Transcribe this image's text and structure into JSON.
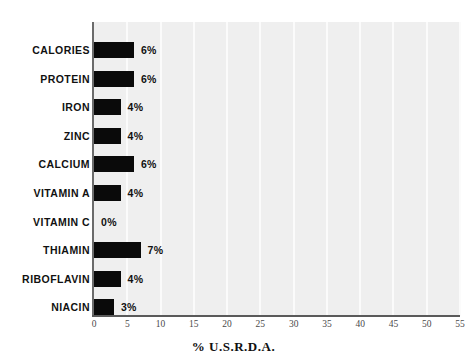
{
  "chart_data": {
    "type": "bar",
    "orientation": "horizontal",
    "title": "",
    "xlabel": "% U.S.R.D.A.",
    "ylabel": "",
    "xlim": [
      0,
      55
    ],
    "xticks": [
      "0",
      "5",
      "10",
      "15",
      "20",
      "25",
      "30",
      "35",
      "40",
      "45",
      "50",
      "55"
    ],
    "xtick_values": [
      0,
      5,
      10,
      15,
      20,
      25,
      30,
      35,
      40,
      45,
      50,
      55
    ],
    "grid": "vertical-white-on-gray",
    "legend": "none",
    "categories": [
      "CALORIES",
      "PROTEIN",
      "IRON",
      "ZINC",
      "CALCIUM",
      "VITAMIN A",
      "VITAMIN C",
      "THIAMIN",
      "RIBOFLAVIN",
      "NIACIN"
    ],
    "values": [
      6,
      6,
      4,
      4,
      6,
      4,
      0,
      7,
      4,
      3
    ],
    "data_labels": [
      "6%",
      "6%",
      "4%",
      "4%",
      "6%",
      "4%",
      "0%",
      "7%",
      "4%",
      "3%"
    ],
    "bar_color": "#0a0a0a",
    "plot_background": "#efefef",
    "gridline_color": "#fbfbfb",
    "axis_color": "#5a5a5a"
  }
}
